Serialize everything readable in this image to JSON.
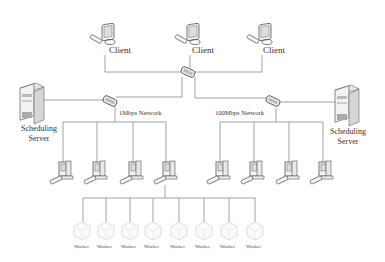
{
  "diagram": {
    "type": "network-topology",
    "clients": [
      {
        "label": "Client",
        "x": 108
      },
      {
        "label": "Client",
        "x": 186
      },
      {
        "label": "Client",
        "x": 263
      }
    ],
    "networks": {
      "left": {
        "label": "1Mbps Network"
      },
      "right": {
        "label": "100Mbps Network"
      }
    },
    "servers": {
      "left": {
        "line1": "Scheduling",
        "line2": "Server"
      },
      "right": {
        "line1": "Scheduling",
        "line2": "Server"
      }
    },
    "workers": [
      {
        "label": "Worker"
      },
      {
        "label": "Worker"
      },
      {
        "label": "Worker"
      },
      {
        "label": "Worker"
      },
      {
        "label": "Worker"
      },
      {
        "label": "Worker"
      },
      {
        "label": "Worker"
      },
      {
        "label": "Worker"
      }
    ],
    "colors": {
      "line": "#8a8a8a",
      "stroke": "#555555",
      "fill": "#f2f2f2"
    }
  }
}
